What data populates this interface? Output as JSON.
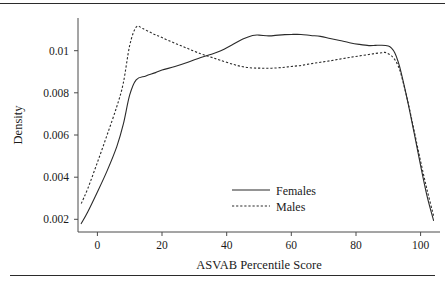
{
  "figure": {
    "rule_top": "horizontal-rule",
    "rule_bottom": "horizontal-rule"
  },
  "chart_data": {
    "type": "line",
    "title": "",
    "xlabel": "ASVAB Percentile Score",
    "ylabel": "Density",
    "xlim": [
      -6,
      106
    ],
    "ylim": [
      0.0014,
      0.01155
    ],
    "grid": false,
    "legend_position": "center-right",
    "xticks": [
      0,
      20,
      40,
      60,
      80,
      100
    ],
    "xtick_labels": [
      "0",
      "20",
      "40",
      "60",
      "80",
      "100"
    ],
    "yticks": [
      0.002,
      0.004,
      0.006,
      0.008,
      0.01
    ],
    "ytick_labels": [
      "0.002",
      "0.004",
      "0.006",
      "0.008",
      "0.01"
    ],
    "series": [
      {
        "name": "Females",
        "style": "solid",
        "color": "#2a2a2a",
        "x": [
          -5,
          -3,
          0,
          3,
          6,
          8,
          10,
          12,
          15,
          18,
          20,
          24,
          28,
          32,
          35,
          38,
          42,
          45,
          48,
          50,
          53,
          56,
          58,
          60,
          63,
          66,
          69,
          72,
          75,
          78,
          81,
          84,
          86,
          88,
          90,
          91,
          92,
          93,
          94,
          96,
          98,
          100,
          102,
          104
        ],
        "y": [
          0.0018,
          0.00235,
          0.0033,
          0.0043,
          0.00545,
          0.0065,
          0.0079,
          0.00862,
          0.0088,
          0.00896,
          0.00908,
          0.00925,
          0.00945,
          0.00968,
          0.00982,
          0.00998,
          0.0103,
          0.01055,
          0.01072,
          0.01074,
          0.0107,
          0.01074,
          0.01076,
          0.01077,
          0.01077,
          0.01072,
          0.01068,
          0.01058,
          0.01048,
          0.01038,
          0.0103,
          0.01024,
          0.01025,
          0.01026,
          0.01022,
          0.01012,
          0.0099,
          0.0095,
          0.00895,
          0.0076,
          0.0061,
          0.00455,
          0.0031,
          0.00195
        ]
      },
      {
        "name": "Males",
        "style": "dotted",
        "color": "#2a2a2a",
        "x": [
          -5,
          -3,
          0,
          3,
          6,
          8,
          10,
          12,
          14,
          17,
          20,
          24,
          28,
          32,
          35,
          38,
          42,
          45,
          48,
          51,
          54,
          57,
          60,
          63,
          66,
          69,
          72,
          75,
          78,
          81,
          84,
          86,
          88,
          89,
          90,
          91,
          92,
          93,
          94,
          96,
          98,
          100,
          102,
          104
        ],
        "y": [
          0.00275,
          0.00345,
          0.0047,
          0.006,
          0.00735,
          0.00845,
          0.01025,
          0.01112,
          0.01105,
          0.01082,
          0.01062,
          0.01035,
          0.0101,
          0.00985,
          0.0097,
          0.00955,
          0.00935,
          0.00924,
          0.00918,
          0.00917,
          0.00917,
          0.0092,
          0.00925,
          0.0093,
          0.00938,
          0.00945,
          0.00952,
          0.0096,
          0.00968,
          0.00975,
          0.00982,
          0.00987,
          0.0099,
          0.00992,
          0.00985,
          0.00975,
          0.00958,
          0.0093,
          0.00885,
          0.00762,
          0.0062,
          0.00475,
          0.0034,
          0.00218
        ]
      }
    ]
  },
  "legend": {
    "entries": [
      {
        "label": "Females",
        "style": "solid"
      },
      {
        "label": "Males",
        "style": "dotted"
      }
    ]
  }
}
